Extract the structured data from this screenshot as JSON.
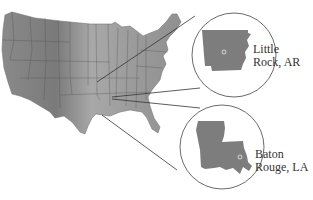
{
  "map": {
    "region": "Contiguous United States",
    "style": "grayscale relief with state borders",
    "colors": {
      "land": "#8c8c8c",
      "land_light": "#b4b4b4",
      "land_dark": "#6e6e6e",
      "borders": "#4a4a4a",
      "callout_lines": "#333333",
      "background": "#ffffff"
    }
  },
  "insets": [
    {
      "state": "Arkansas",
      "city_label_line1": "Little",
      "city_label_line2": "Rock, AR",
      "city": "Little Rock",
      "abbr": "AR"
    },
    {
      "state": "Louisiana",
      "city_label_line1": "Baton",
      "city_label_line2": "Rouge, LA",
      "city": "Baton Rouge",
      "abbr": "LA"
    }
  ]
}
